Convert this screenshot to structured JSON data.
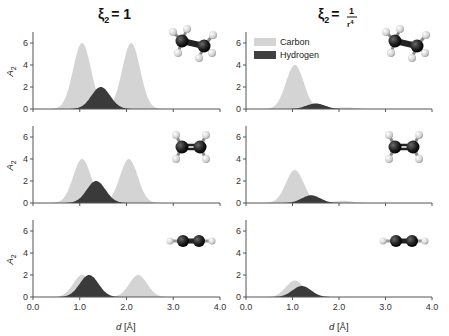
{
  "figure": {
    "columns": [
      {
        "title_main": "ξ",
        "title_sub": "2",
        "title_eq": "= 1",
        "title_frac": null
      },
      {
        "title_main": "ξ",
        "title_sub": "2",
        "title_eq": "=",
        "title_frac": {
          "num": "1",
          "den": "r",
          "den_sup": "4"
        }
      }
    ],
    "ylabel": "A",
    "ylabel_sub": "2",
    "xlabel_italic": "d",
    "xlabel_unit": " [Å]",
    "xticks": [
      "0.0",
      "1.0",
      "2.0",
      "3.0",
      "4.0"
    ],
    "yticks": [
      "0",
      "2",
      "4",
      "6"
    ],
    "legend": [
      {
        "label": "Carbon",
        "color": "#d4d4d4"
      },
      {
        "label": "Hydrogen",
        "color": "#404040"
      }
    ],
    "molecules": [
      "ethane",
      "ethene",
      "ethyne"
    ]
  },
  "colors": {
    "carbon": "#d4d4d4",
    "hydrogen": "#3a3a3a",
    "axis": "#555555"
  },
  "chart_data": [
    {
      "type": "area",
      "row": 0,
      "col": 0,
      "molecule": "ethane",
      "xlim": [
        0,
        4
      ],
      "ylim": [
        0,
        7
      ],
      "series": [
        {
          "name": "Carbon",
          "peaks": [
            {
              "x": 1.05,
              "height": 6.0,
              "sigma": 0.19
            },
            {
              "x": 2.1,
              "height": 6.0,
              "sigma": 0.19
            }
          ]
        },
        {
          "name": "Hydrogen",
          "peaks": [
            {
              "x": 1.45,
              "height": 2.0,
              "sigma": 0.2
            }
          ]
        }
      ]
    },
    {
      "type": "area",
      "row": 0,
      "col": 1,
      "molecule": "ethane",
      "xlim": [
        0,
        4
      ],
      "ylim": [
        0,
        7
      ],
      "series": [
        {
          "name": "Carbon",
          "peaks": [
            {
              "x": 1.05,
              "height": 4.0,
              "sigma": 0.19
            },
            {
              "x": 2.15,
              "height": 0.15,
              "sigma": 0.2
            }
          ]
        },
        {
          "name": "Hydrogen",
          "peaks": [
            {
              "x": 1.5,
              "height": 0.5,
              "sigma": 0.2
            }
          ]
        }
      ]
    },
    {
      "type": "area",
      "row": 1,
      "col": 0,
      "molecule": "ethene",
      "xlim": [
        0,
        4
      ],
      "ylim": [
        0,
        7
      ],
      "series": [
        {
          "name": "Carbon",
          "peaks": [
            {
              "x": 1.05,
              "height": 4.0,
              "sigma": 0.19
            },
            {
              "x": 2.05,
              "height": 4.0,
              "sigma": 0.19
            }
          ]
        },
        {
          "name": "Hydrogen",
          "peaks": [
            {
              "x": 1.35,
              "height": 2.0,
              "sigma": 0.2
            }
          ]
        }
      ]
    },
    {
      "type": "area",
      "row": 1,
      "col": 1,
      "molecule": "ethene",
      "xlim": [
        0,
        4
      ],
      "ylim": [
        0,
        7
      ],
      "series": [
        {
          "name": "Carbon",
          "peaks": [
            {
              "x": 1.05,
              "height": 3.0,
              "sigma": 0.19
            },
            {
              "x": 2.1,
              "height": 0.2,
              "sigma": 0.2
            }
          ]
        },
        {
          "name": "Hydrogen",
          "peaks": [
            {
              "x": 1.4,
              "height": 0.7,
              "sigma": 0.2
            }
          ]
        }
      ]
    },
    {
      "type": "area",
      "row": 2,
      "col": 0,
      "molecule": "ethyne",
      "xlim": [
        0,
        4
      ],
      "ylim": [
        0,
        7
      ],
      "series": [
        {
          "name": "Carbon",
          "peaks": [
            {
              "x": 1.05,
              "height": 2.0,
              "sigma": 0.19
            },
            {
              "x": 2.25,
              "height": 2.0,
              "sigma": 0.19
            }
          ]
        },
        {
          "name": "Hydrogen",
          "peaks": [
            {
              "x": 1.2,
              "height": 2.0,
              "sigma": 0.2
            }
          ]
        }
      ]
    },
    {
      "type": "area",
      "row": 2,
      "col": 1,
      "molecule": "ethyne",
      "xlim": [
        0,
        4
      ],
      "ylim": [
        0,
        7
      ],
      "series": [
        {
          "name": "Carbon",
          "peaks": [
            {
              "x": 1.05,
              "height": 1.5,
              "sigma": 0.19
            }
          ]
        },
        {
          "name": "Hydrogen",
          "peaks": [
            {
              "x": 1.2,
              "height": 1.0,
              "sigma": 0.2
            }
          ]
        }
      ]
    }
  ]
}
